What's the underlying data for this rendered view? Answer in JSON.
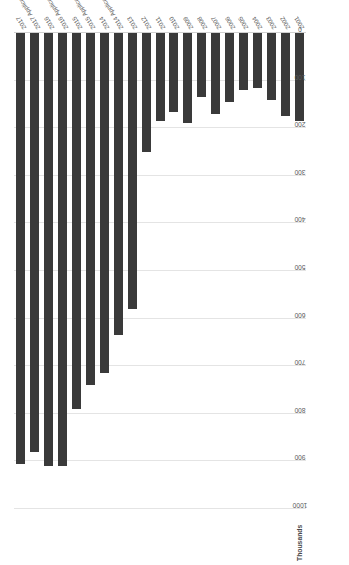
{
  "chart_data": {
    "type": "bar",
    "orientation": "horizontal",
    "title": "",
    "subtitle": "",
    "xlabel": "",
    "ylabel": "",
    "axis_units": "Thousands",
    "grid": true,
    "legend": "none",
    "value_axis": {
      "min": 0,
      "max": 1000,
      "step": 100,
      "reversed": true,
      "ticks": [
        1000,
        900,
        800,
        700,
        600,
        500,
        400,
        300,
        200,
        100,
        0
      ],
      "tick_labels": [
        "1000",
        "900",
        "800",
        "700",
        "600",
        "500",
        "400",
        "300",
        "200",
        "100",
        "0"
      ]
    },
    "categories": [
      "2017",
      "2017 Applications",
      "2016",
      "2016 Applications",
      "2015",
      "2015 Applications",
      "2014",
      "2014 Applications",
      "2013",
      "2012",
      "2011",
      "2010",
      "2009",
      "2008",
      "2007",
      "2006",
      "2005",
      "2004",
      "2003",
      "2002",
      "2001"
    ],
    "values": [
      905,
      880,
      910,
      910,
      790,
      740,
      715,
      635,
      580,
      250,
      185,
      165,
      190,
      135,
      170,
      145,
      120,
      115,
      140,
      175,
      185
    ],
    "bar_color": "#3a3a3a",
    "grid_color": "#e4e4e4",
    "background": "#ffffff"
  },
  "page": {
    "units_caption": "Thousands"
  }
}
